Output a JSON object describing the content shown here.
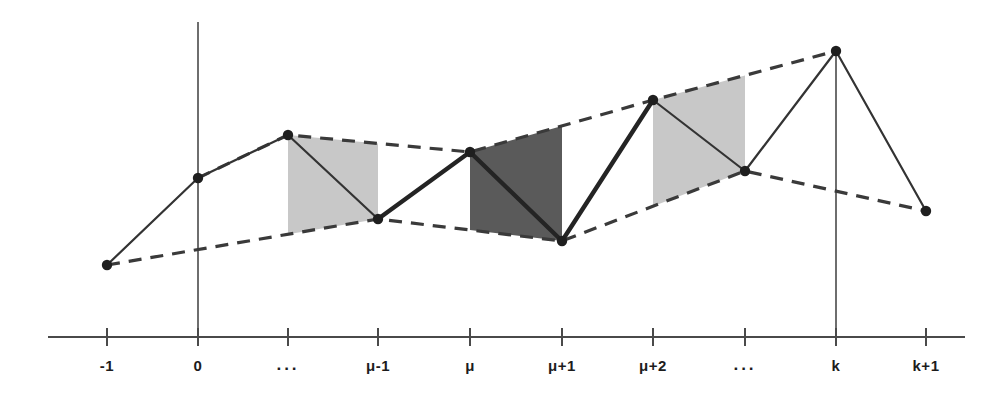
{
  "figure": {
    "title": "",
    "background_color": "#ffffff",
    "width": 1008,
    "height": 403
  },
  "chart_data": {
    "type": "line",
    "title": "",
    "xlabel": "",
    "ylabel": "",
    "grid": false,
    "legend": "none",
    "categories": [
      "-1",
      "0",
      "···",
      "μ-1",
      "μ",
      "μ+1",
      "μ+2",
      "···",
      "k",
      "k+1"
    ],
    "x_pixels": [
      107,
      198,
      288,
      378,
      470,
      562,
      653,
      745,
      836,
      926
    ],
    "y_pixels": [
      265,
      178,
      135,
      219,
      152,
      241,
      100,
      171,
      51,
      211
    ],
    "values": [
      72,
      159,
      202,
      118,
      185,
      96,
      237,
      166,
      286,
      126
    ],
    "axis": {
      "x_axis_y_pixel": 337,
      "x_axis_start_pixel": 48,
      "x_axis_end_pixel": 965,
      "y_axis_x_pixel": 198,
      "y_axis_top_pixel": 22,
      "vertical_marker_at": "k",
      "vertical_marker_x_pixel": 836,
      "vertical_marker_top_pixel": 51
    },
    "series": [
      {
        "name": "solid-polyline",
        "style": "solid",
        "color": "#333333",
        "marker": "filled-circle",
        "point_indices": [
          0,
          1,
          2,
          3,
          4,
          5,
          6,
          7,
          8,
          9
        ]
      },
      {
        "name": "upper-envelope",
        "style": "dashed",
        "color": "#3a3a3a",
        "point_indices": [
          1,
          2,
          4,
          6,
          8
        ]
      },
      {
        "name": "lower-envelope",
        "style": "dashed",
        "color": "#3a3a3a",
        "point_indices": [
          0,
          3,
          5,
          7,
          9
        ]
      }
    ],
    "shaded_bands": [
      {
        "name": "band-light-left",
        "from_category": "···",
        "to_category": "μ-1",
        "from_index": 2,
        "to_index": 3,
        "color": "#b8b8b8",
        "shade": "light"
      },
      {
        "name": "band-dark-middle",
        "from_category": "μ",
        "to_category": "μ+1",
        "from_index": 4,
        "to_index": 5,
        "color": "#4c4c4c",
        "shade": "dark"
      },
      {
        "name": "band-light-right",
        "from_category": "μ+2",
        "to_category": "···",
        "from_index": 6,
        "to_index": 7,
        "color": "#b8b8b8",
        "shade": "light"
      }
    ]
  },
  "ticks": [
    {
      "label": "-1",
      "x": 107,
      "is_dots": false
    },
    {
      "label": "0",
      "x": 198,
      "is_dots": false
    },
    {
      "label": "···",
      "x": 288,
      "is_dots": true
    },
    {
      "label": "μ-1",
      "x": 378,
      "is_dots": false
    },
    {
      "label": "μ",
      "x": 470,
      "is_dots": false
    },
    {
      "label": "μ+1",
      "x": 562,
      "is_dots": false
    },
    {
      "label": "μ+2",
      "x": 653,
      "is_dots": false
    },
    {
      "label": "···",
      "x": 745,
      "is_dots": true
    },
    {
      "label": "k",
      "x": 836,
      "is_dots": false
    },
    {
      "label": "k+1",
      "x": 926,
      "is_dots": false
    }
  ],
  "colors": {
    "line": "#333333",
    "dashed": "#3a3a3a",
    "axis": "#4a4a4a",
    "marker": "#1f1f1f",
    "band_light": "#b8b8b8",
    "band_dark": "#4c4c4c",
    "text": "#1c1c1c"
  }
}
